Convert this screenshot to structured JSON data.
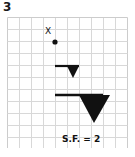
{
  "question": {
    "number": "3"
  },
  "grid": {
    "columns": 10,
    "rows": 11,
    "cell_size_px": 12,
    "line_color": "#d8d8d8",
    "border_color": "#cccccc",
    "origin_x_px": 7,
    "origin_y_px": 17,
    "width_px": 121,
    "height_px": 131
  },
  "annotations": {
    "center_of_enlargement_label": "X",
    "center_of_enlargement_label_x_px": 38,
    "center_of_enlargement_label_y_px": 10,
    "scale_factor_text": "S.F. = 2",
    "scale_factor_x_px": 55,
    "scale_factor_y_px": 117
  },
  "figure": {
    "ink_color": "#111111",
    "center_point": {
      "name": "center-of-enlargement-point",
      "cx_px": 48,
      "cy_px": 25,
      "r_px": 2.6
    },
    "original_shape": {
      "name": "original-flag-shape",
      "bar": {
        "x1_px": 48,
        "y1_px": 49,
        "x2_px": 72,
        "y2_px": 49,
        "thickness_px": 2.2
      },
      "triangle_points": "60,49 72,49 66,61"
    },
    "image_shape": {
      "name": "enlarged-flag-shape",
      "bar": {
        "x1_px": 48,
        "y1_px": 78,
        "x2_px": 96,
        "y2_px": 78,
        "thickness_px": 2.6
      },
      "triangle_points": "72,78 103,78 87,106"
    }
  }
}
